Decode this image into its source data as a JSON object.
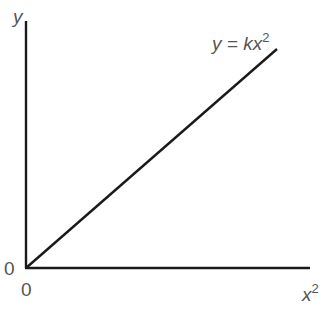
{
  "figure": {
    "type": "proportionality-graph",
    "axes": {
      "y_label": "y",
      "x_label_base": "x",
      "x_label_exp": "2",
      "origin_y_label": "0",
      "origin_x_label": "0"
    },
    "line": {
      "label_prefix": "y = k",
      "label_var": "x",
      "label_exp": "2",
      "from": [
        0,
        0
      ],
      "to": [
        0.88,
        0.89
      ]
    },
    "colors": {
      "axis": "#1a1a1a",
      "line": "#1a1a1a",
      "text": "#555555"
    }
  }
}
